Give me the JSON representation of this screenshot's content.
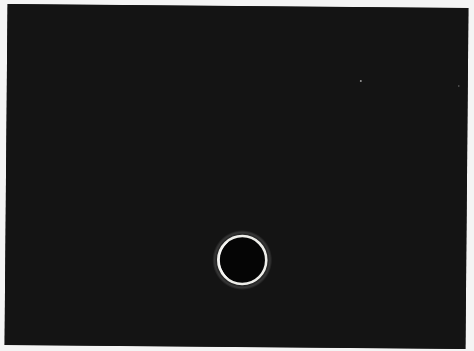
{
  "image": {
    "subject": "Annular solar eclipse (ring of fire) against a dark sky",
    "background_color": "#141414",
    "frame_color": "#f4f4f4",
    "ring_color": "#f0f0ea",
    "stars": 2
  }
}
